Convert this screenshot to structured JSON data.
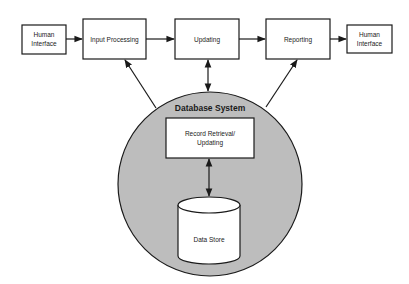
{
  "diagram": {
    "type": "flow",
    "nodes": {
      "human_interface_left": {
        "line1": "Human",
        "line2": "Interface"
      },
      "input_processing": {
        "label": "Input Processing"
      },
      "updating": {
        "label": "Updating"
      },
      "reporting": {
        "label": "Reporting"
      },
      "human_interface_right": {
        "line1": "Human",
        "line2": "Interface"
      },
      "database_system": {
        "label": "Database System"
      },
      "record_retrieval": {
        "line1": "Record Retrieval/",
        "line2": "Updating"
      },
      "data_store": {
        "label": "Data Store"
      }
    },
    "edges": [
      {
        "from": "Human Interface",
        "to": "Input Processing",
        "direction": "forward"
      },
      {
        "from": "Input Processing",
        "to": "Updating",
        "direction": "forward"
      },
      {
        "from": "Updating",
        "to": "Reporting",
        "direction": "forward"
      },
      {
        "from": "Reporting",
        "to": "Human Interface",
        "direction": "forward"
      },
      {
        "from": "Database System",
        "to": "Input Processing",
        "direction": "forward"
      },
      {
        "from": "Database System",
        "to": "Updating",
        "direction": "bidirectional"
      },
      {
        "from": "Database System",
        "to": "Reporting",
        "direction": "forward"
      },
      {
        "from": "Record Retrieval/Updating",
        "to": "Data Store",
        "direction": "bidirectional"
      }
    ],
    "colors": {
      "circle_fill": "#bdbdbd",
      "stroke": "#1a1a1a",
      "box_fill": "#ffffff"
    }
  }
}
